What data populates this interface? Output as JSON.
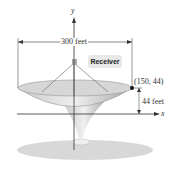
{
  "diagram": {
    "axis_y_label": "y",
    "axis_x_label": "x",
    "width_label": "300 feet",
    "receiver_label": "Receiver",
    "point_label": "(150, 44)",
    "height_label": "44 feet"
  }
}
